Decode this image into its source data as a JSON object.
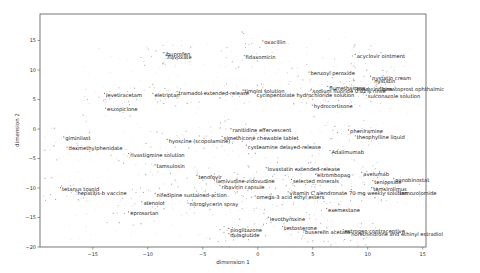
{
  "chart_data": {
    "type": "scatter",
    "title": "",
    "xlabel": "dimension 1",
    "ylabel": "dimension 2",
    "xlim": [
      -19.8,
      15.3
    ],
    "ylim": [
      -20,
      19.5
    ],
    "grid": false,
    "legend": null,
    "xticks": [
      -15,
      -10,
      -5,
      0,
      5,
      10,
      15
    ],
    "yticks": [
      -20,
      -15,
      -10,
      -5,
      0,
      5,
      10,
      15
    ],
    "point_color": "#9a9a9a",
    "annotations": [
      {
        "text": "oxacillin",
        "x": 0.6,
        "y": 14.7
      },
      {
        "text": "flavoxate",
        "x": -8.2,
        "y": 12.2
      },
      {
        "text": "ibuprofen",
        "x": -8.4,
        "y": 12.7
      },
      {
        "text": "fidaxomicin",
        "x": -1.1,
        "y": 12.2
      },
      {
        "text": "acyclovir ointment",
        "x": 9.0,
        "y": 12.4
      },
      {
        "text": "benzoyl peroxide",
        "x": 4.8,
        "y": 9.4
      },
      {
        "text": "nystatin cream",
        "x": 10.4,
        "y": 8.7
      },
      {
        "text": "nystatin",
        "x": 10.6,
        "y": 8.1
      },
      {
        "text": "flumethasone",
        "x": 6.5,
        "y": 7.0
      },
      {
        "text": "sodium fluoride 0.02% rinse",
        "x": 5.0,
        "y": 6.5
      },
      {
        "text": "triamcinolone",
        "x": 9.0,
        "y": 6.8
      },
      {
        "text": "bimatoprost ophthalmic",
        "x": 11.3,
        "y": 6.8
      },
      {
        "text": "sulconazole solution",
        "x": 10.0,
        "y": 5.5
      },
      {
        "text": "hydrocortisone",
        "x": 5.1,
        "y": 3.8
      },
      {
        "text": "timolol solution",
        "x": -1.2,
        "y": 6.4
      },
      {
        "text": "levetiracetam",
        "x": -13.8,
        "y": 5.8
      },
      {
        "text": "eletriptan",
        "x": -9.4,
        "y": 5.8
      },
      {
        "text": "tramadol extended-release",
        "x": -7.2,
        "y": 6.1
      },
      {
        "text": "cyclopentolate hydrochloride solution",
        "x": -0.1,
        "y": 5.8
      },
      {
        "text": "eszopiclone",
        "x": -13.7,
        "y": 3.3
      },
      {
        "text": "ranitidine effervescent",
        "x": -2.3,
        "y": -0.2
      },
      {
        "text": "simethicone chewable tablet",
        "x": -3.1,
        "y": -1.5
      },
      {
        "text": "hyoscine (scopolamine)",
        "x": -8.1,
        "y": -2.0
      },
      {
        "text": "cysteamine delayed-release",
        "x": -0.9,
        "y": -3.0
      },
      {
        "text": "pheniramine",
        "x": 8.4,
        "y": -0.4
      },
      {
        "text": "theophylline liquid",
        "x": 9.0,
        "y": -1.4
      },
      {
        "text": "Adalimumab",
        "x": 6.7,
        "y": -3.9
      },
      {
        "text": "giminilast",
        "x": -17.5,
        "y": -1.6
      },
      {
        "text": "dexmethylphenidate",
        "x": -17.2,
        "y": -3.3
      },
      {
        "text": "rivastigmine solution",
        "x": -11.6,
        "y": -4.4
      },
      {
        "text": "tamsulosin",
        "x": -9.2,
        "y": -6.3
      },
      {
        "text": "lovastatin extended-release",
        "x": 0.9,
        "y": -6.8
      },
      {
        "text": "avelumab",
        "x": 9.6,
        "y": -7.6
      },
      {
        "text": "eltrombopag",
        "x": 5.4,
        "y": -7.9
      },
      {
        "text": "selected minerals",
        "x": 3.2,
        "y": -8.8
      },
      {
        "text": "tenofovir",
        "x": -5.4,
        "y": -8.1
      },
      {
        "text": "lamivudine-zidovudine",
        "x": -3.8,
        "y": -8.9
      },
      {
        "text": "ribavirin capsule",
        "x": -3.3,
        "y": -9.8
      },
      {
        "text": "teniposide",
        "x": 10.6,
        "y": -9.0
      },
      {
        "text": "panobinostat",
        "x": 12.5,
        "y": -8.6
      },
      {
        "text": "temsirolimus",
        "x": 10.5,
        "y": -10.2
      },
      {
        "text": "temozolomide",
        "x": 12.9,
        "y": -10.8
      },
      {
        "text": "tetanus toxoid",
        "x": -17.8,
        "y": -10.2
      },
      {
        "text": "hepatitis-b vaccine",
        "x": -16.4,
        "y": -10.8
      },
      {
        "text": "vitamin C",
        "x": 2.9,
        "y": -10.9
      },
      {
        "text": "alendronate 70 mg weekly solution",
        "x": 5.3,
        "y": -10.9
      },
      {
        "text": "nifedipine sustained-action",
        "x": -9.2,
        "y": -11.2
      },
      {
        "text": "omega-3 acid ethyl esters",
        "x": -0.1,
        "y": -11.6
      },
      {
        "text": "atenolol",
        "x": -10.4,
        "y": -12.6
      },
      {
        "text": "nitroglycerin spray",
        "x": -6.2,
        "y": -12.8
      },
      {
        "text": "eprosartan",
        "x": -11.6,
        "y": -14.3
      },
      {
        "text": "exemestane",
        "x": 6.4,
        "y": -13.7
      },
      {
        "text": "levothyroxine",
        "x": 1.1,
        "y": -15.2
      },
      {
        "text": "testosterone",
        "x": 2.4,
        "y": -16.8
      },
      {
        "text": "buserelin acetate",
        "x": 4.3,
        "y": -17.5
      },
      {
        "text": "estrogen contraceptive",
        "x": 7.9,
        "y": -17.3
      },
      {
        "text": "norethindrone and ethinyl estradiol",
        "x": 8.5,
        "y": -17.9
      },
      {
        "text": "pioglitazone",
        "x": -2.5,
        "y": -17.1
      },
      {
        "text": "dulaglutide",
        "x": -2.5,
        "y": -18.0
      }
    ]
  },
  "figure": {
    "xlabel": "dimension 1",
    "ylabel": "dimension 2",
    "xtick_labels": [
      "−15",
      "−10",
      "−5",
      "0",
      "5",
      "10",
      "15"
    ],
    "ytick_labels": [
      "15",
      "10",
      "5",
      "0",
      "−5",
      "−10",
      "−15",
      "−20"
    ]
  }
}
